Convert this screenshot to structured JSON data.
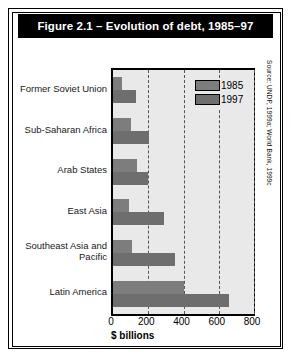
{
  "figure": {
    "title": "Figure 2.1 – Evolution of debt, 1985–97",
    "source": "Source: UNDP, 1999a; World Bank, 1999c"
  },
  "legend": {
    "entries": [
      {
        "label": "1985",
        "color": "#7d7d7d"
      },
      {
        "label": "1997",
        "color": "#6e6e6e"
      }
    ]
  },
  "axis": {
    "xlabel": "$ billions",
    "ticks": [
      "0",
      "200",
      "400",
      "600",
      "800"
    ]
  },
  "chart_data": {
    "type": "bar",
    "orientation": "horizontal",
    "title": "Figure 2.1 – Evolution of debt, 1985–97",
    "xlabel": "$ billions",
    "ylabel": "",
    "xlim": [
      0,
      800
    ],
    "xticks": [
      0,
      200,
      400,
      600,
      800
    ],
    "grid": true,
    "grid_style": "dashed vertical",
    "legend_position": "upper right inside plot",
    "categories": [
      "Former Soviet Union",
      "Sub-Saharan Africa",
      "Arab States",
      "East Asia",
      "Southeast Asia and Pacific",
      "Latin America"
    ],
    "series": [
      {
        "name": "1985",
        "color": "#7d7d7d",
        "values": [
          50,
          100,
          135,
          90,
          110,
          400
        ]
      },
      {
        "name": "1997",
        "color": "#6e6e6e",
        "values": [
          130,
          205,
          200,
          290,
          350,
          660
        ]
      }
    ],
    "source": "Source: UNDP, 1999a; World Bank, 1999c"
  }
}
